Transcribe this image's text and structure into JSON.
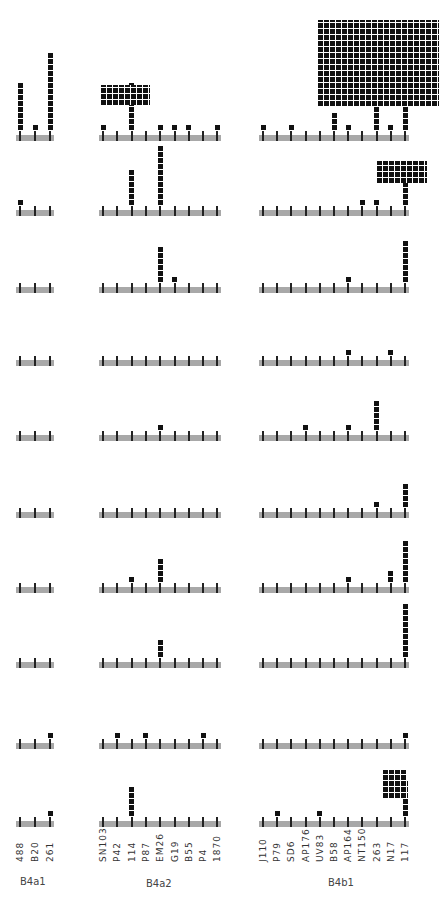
{
  "chart_data": {
    "type": "dot-histogram",
    "title": "",
    "groups": [
      {
        "name": "B4a1",
        "strains": [
          "488",
          "B20",
          "261"
        ],
        "x0": 19,
        "step": 15
      },
      {
        "name": "B4a2",
        "strains": [
          "SN103",
          "P42",
          "114",
          "P87",
          "EM26",
          "G19",
          "B55",
          "P4",
          "1870"
        ],
        "x0": 102,
        "step": 14.3
      },
      {
        "name": "B4b1",
        "strains": [
          "J110",
          "P79",
          "SD6",
          "AP176",
          "UV83",
          "B58",
          "AP164",
          "NT150",
          "263",
          "N17",
          "117"
        ],
        "x0": 262,
        "step": 14.2
      }
    ],
    "rows_baseline_y": [
      137,
      212,
      289,
      362,
      437,
      514,
      589,
      664,
      745,
      823
    ],
    "counts": [
      {
        "B4a1": [
          8,
          1,
          13
        ],
        "B4a2": [
          1,
          0,
          8,
          0,
          1,
          1,
          1,
          0,
          1
        ],
        "B4b1": [
          1,
          0,
          1,
          0,
          0,
          3,
          1,
          0,
          7,
          1,
          9
        ]
      },
      {
        "B4a1": [
          1,
          0,
          0
        ],
        "B4a2": [
          0,
          0,
          6,
          0,
          10,
          0,
          0,
          0,
          0
        ],
        "B4b1": [
          0,
          0,
          0,
          0,
          0,
          0,
          0,
          1,
          1,
          0,
          7
        ]
      },
      {
        "B4a1": [
          0,
          0,
          0
        ],
        "B4a2": [
          0,
          0,
          0,
          0,
          6,
          1,
          0,
          0,
          0
        ],
        "B4b1": [
          0,
          0,
          0,
          0,
          0,
          0,
          1,
          0,
          0,
          0,
          7
        ]
      },
      {
        "B4a1": [
          0,
          0,
          0
        ],
        "B4a2": [
          0,
          0,
          0,
          0,
          0,
          0,
          0,
          0,
          0
        ],
        "B4b1": [
          0,
          0,
          0,
          0,
          0,
          0,
          1,
          0,
          0,
          1,
          0
        ]
      },
      {
        "B4a1": [
          0,
          0,
          0
        ],
        "B4a2": [
          0,
          0,
          0,
          0,
          1,
          0,
          0,
          0,
          0
        ],
        "B4b1": [
          0,
          0,
          0,
          1,
          0,
          0,
          1,
          0,
          5,
          0,
          0
        ]
      },
      {
        "B4a1": [
          0,
          0,
          0
        ],
        "B4a2": [
          0,
          0,
          0,
          0,
          0,
          0,
          0,
          0,
          0
        ],
        "B4b1": [
          0,
          0,
          0,
          0,
          0,
          0,
          0,
          0,
          1,
          0,
          4
        ]
      },
      {
        "B4a1": [
          0,
          0,
          0
        ],
        "B4a2": [
          0,
          0,
          1,
          0,
          4,
          0,
          0,
          0,
          0
        ],
        "B4b1": [
          0,
          0,
          0,
          0,
          0,
          0,
          1,
          0,
          0,
          2,
          7
        ]
      },
      {
        "B4a1": [
          0,
          0,
          0
        ],
        "B4a2": [
          0,
          0,
          0,
          0,
          3,
          0,
          0,
          0,
          0
        ],
        "B4b1": [
          0,
          0,
          0,
          0,
          0,
          0,
          0,
          0,
          0,
          0,
          9
        ]
      },
      {
        "B4a1": [
          0,
          0,
          1
        ],
        "B4a2": [
          0,
          1,
          0,
          1,
          0,
          0,
          0,
          1,
          0
        ],
        "B4b1": [
          0,
          0,
          0,
          0,
          0,
          0,
          0,
          0,
          0,
          0,
          1
        ]
      },
      {
        "B4a1": [
          0,
          0,
          1
        ],
        "B4a2": [
          0,
          0,
          5,
          0,
          0,
          0,
          0,
          0,
          0
        ],
        "B4b1": [
          0,
          1,
          0,
          0,
          1,
          0,
          0,
          0,
          0,
          0,
          6
        ]
      }
    ],
    "blocks": [
      {
        "row": 0,
        "x": 101,
        "y": 85,
        "w": 49,
        "h": 20,
        "note": "large cluster above 114 (B4a2)"
      },
      {
        "row": 0,
        "x": 318,
        "y": 20,
        "w": 121,
        "h": 86,
        "note": "very large cluster above 117 (B4b1)"
      },
      {
        "row": 1,
        "x": 377,
        "y": 161,
        "w": 50,
        "h": 22,
        "note": "cluster above 117"
      },
      {
        "row": 9,
        "x": 383,
        "y": 770,
        "w": 24,
        "h": 28,
        "note": "cluster above N17/117"
      }
    ],
    "xlabel": "",
    "ylabel": "",
    "grid": false
  },
  "labels": {
    "group_b4a1": "B4a1",
    "group_b4a2": "B4a2",
    "group_b4b1": "B4b1"
  }
}
